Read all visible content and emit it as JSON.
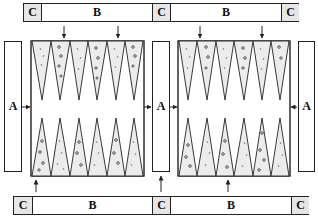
{
  "labels": {
    "a": "A",
    "b": "B",
    "c": "C"
  },
  "top_bar": {
    "segments": [
      "C",
      "B",
      "C",
      "B",
      "C"
    ]
  },
  "bottom_bar": {
    "segments": [
      "C",
      "B",
      "C",
      "B",
      "C"
    ]
  },
  "side_columns": [
    "A",
    "A",
    "A"
  ],
  "boards": [
    {
      "name": "left-board",
      "top_points": [
        "light",
        "dark",
        "light",
        "dark",
        "light",
        "dark"
      ],
      "bottom_points": [
        "dark",
        "light",
        "dark",
        "light",
        "dark",
        "light"
      ]
    },
    {
      "name": "right-board",
      "top_points": [
        "light",
        "dark",
        "light",
        "dark",
        "light",
        "dark"
      ],
      "bottom_points": [
        "dark",
        "light",
        "dark",
        "light",
        "dark",
        "light"
      ]
    }
  ],
  "colors": {
    "line": "#222222",
    "point_fill": "#ececec",
    "c_fill": "#e6e6e6"
  }
}
